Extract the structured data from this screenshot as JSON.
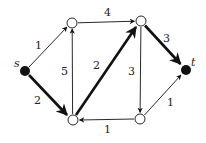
{
  "colors": {
    "ink": "#111111",
    "label": "#222222",
    "node_fill_open": "#ffffff",
    "node_fill_terminal": "#111111"
  },
  "nodes": [
    {
      "id": "s",
      "label": "s",
      "x": 25,
      "y": 71,
      "terminal": true
    },
    {
      "id": "a",
      "label": "",
      "x": 72,
      "y": 23,
      "terminal": false
    },
    {
      "id": "b",
      "label": "",
      "x": 141,
      "y": 21,
      "terminal": false
    },
    {
      "id": "t",
      "label": "t",
      "x": 186,
      "y": 70,
      "terminal": true
    },
    {
      "id": "c",
      "label": "",
      "x": 73,
      "y": 120,
      "terminal": false
    },
    {
      "id": "d",
      "label": "",
      "x": 140,
      "y": 119,
      "terminal": false
    }
  ],
  "edges": [
    {
      "from": "s",
      "to": "a",
      "weight": "1",
      "bold": false
    },
    {
      "from": "s",
      "to": "c",
      "weight": "2",
      "bold": true
    },
    {
      "from": "c",
      "to": "a",
      "weight": "5",
      "bold": false
    },
    {
      "from": "a",
      "to": "b",
      "weight": "4",
      "bold": false
    },
    {
      "from": "c",
      "to": "b",
      "weight": "2",
      "bold": true
    },
    {
      "from": "b",
      "to": "d",
      "weight": "3",
      "bold": false
    },
    {
      "from": "b",
      "to": "t",
      "weight": "3",
      "bold": true
    },
    {
      "from": "d",
      "to": "c",
      "weight": "1",
      "bold": false
    },
    {
      "from": "d",
      "to": "t",
      "weight": "1",
      "bold": false
    }
  ],
  "labels": {
    "s": "s",
    "t": "t",
    "e_sa": "1",
    "e_sc": "2",
    "e_ca": "5",
    "e_ab": "4",
    "e_cb": "2",
    "e_bd": "3",
    "e_bt": "3",
    "e_dc": "1",
    "e_dt": "1"
  }
}
